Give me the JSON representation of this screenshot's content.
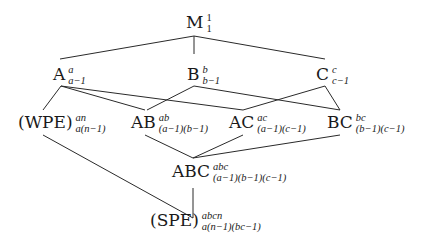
{
  "diagram": {
    "type": "lattice",
    "nodes": [
      {
        "id": "M",
        "label": "M",
        "sup": "1",
        "sub": "1",
        "x": 186,
        "y": 28
      },
      {
        "id": "A",
        "label": "A",
        "sup": "a",
        "sub": "a−1",
        "x": 53,
        "y": 80
      },
      {
        "id": "B",
        "label": "B",
        "sup": "b",
        "sub": "b−1",
        "x": 187,
        "y": 80
      },
      {
        "id": "C",
        "label": "C",
        "sup": "c",
        "sub": "c−1",
        "x": 316,
        "y": 80
      },
      {
        "id": "WPE",
        "label": "(WPE)",
        "sup": "an",
        "sub": "a(n−1)",
        "x": 18,
        "y": 128
      },
      {
        "id": "AB",
        "label": "AB",
        "sup": "ab",
        "sub": "(a−1)(b−1)",
        "x": 131,
        "y": 128
      },
      {
        "id": "AC",
        "label": "AC",
        "sup": "ac",
        "sub": "(a−1)(c−1)",
        "x": 229,
        "y": 128
      },
      {
        "id": "BC",
        "label": "BC",
        "sup": "bc",
        "sub": "(b−1)(c−1)",
        "x": 327,
        "y": 128
      },
      {
        "id": "ABC",
        "label": "ABC",
        "sup": "abc",
        "sub": "(a−1)(b−1)(c−1)",
        "x": 172,
        "y": 177
      },
      {
        "id": "SPE",
        "label": "(SPE)",
        "sup": "abcn",
        "sub": "a(n−1)(bc−1)",
        "x": 150,
        "y": 226
      }
    ],
    "edges": [
      {
        "from": "M",
        "to": "A",
        "x1": 194,
        "y1": 36,
        "x2": 60,
        "y2": 59
      },
      {
        "from": "M",
        "to": "B",
        "x1": 194,
        "y1": 36,
        "x2": 194,
        "y2": 54
      },
      {
        "from": "M",
        "to": "C",
        "x1": 194,
        "y1": 36,
        "x2": 325,
        "y2": 59
      },
      {
        "from": "A",
        "to": "WPE",
        "x1": 61,
        "y1": 86,
        "x2": 43,
        "y2": 110
      },
      {
        "from": "A",
        "to": "AB",
        "x1": 61,
        "y1": 86,
        "x2": 145,
        "y2": 110
      },
      {
        "from": "A",
        "to": "AC",
        "x1": 61,
        "y1": 86,
        "x2": 243,
        "y2": 110
      },
      {
        "from": "B",
        "to": "AB",
        "x1": 194,
        "y1": 86,
        "x2": 147,
        "y2": 110
      },
      {
        "from": "B",
        "to": "BC",
        "x1": 194,
        "y1": 86,
        "x2": 340,
        "y2": 110
      },
      {
        "from": "C",
        "to": "AC",
        "x1": 325,
        "y1": 86,
        "x2": 243,
        "y2": 110
      },
      {
        "from": "C",
        "to": "BC",
        "x1": 325,
        "y1": 86,
        "x2": 340,
        "y2": 110
      },
      {
        "from": "WPE",
        "to": "SPE",
        "x1": 43,
        "y1": 135,
        "x2": 193,
        "y2": 218
      },
      {
        "from": "AB",
        "to": "ABC",
        "x1": 145,
        "y1": 135,
        "x2": 193,
        "y2": 158
      },
      {
        "from": "AC",
        "to": "ABC",
        "x1": 243,
        "y1": 135,
        "x2": 193,
        "y2": 158
      },
      {
        "from": "BC",
        "to": "ABC",
        "x1": 340,
        "y1": 135,
        "x2": 193,
        "y2": 158
      },
      {
        "from": "ABC",
        "to": "SPE",
        "x1": 193,
        "y1": 188,
        "x2": 193,
        "y2": 218
      }
    ]
  }
}
